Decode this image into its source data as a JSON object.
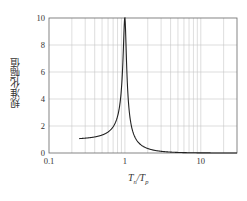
{
  "chart_data": {
    "type": "line",
    "title": "",
    "xlabel": "Tn/Tp",
    "xlabel_parts": {
      "main1": "T",
      "sub1": "n",
      "sep": "/",
      "main2": "T",
      "sub2": "p"
    },
    "ylabel": "规准化幅值",
    "xscale": "log",
    "xlim": [
      0.1,
      30
    ],
    "ylim": [
      0,
      10
    ],
    "xticks": [
      0.1,
      1,
      10
    ],
    "xtick_labels": [
      "0.1",
      "1",
      "10"
    ],
    "yticks": [
      0,
      2,
      4,
      6,
      8,
      10
    ],
    "ytick_labels": [
      "0",
      "2",
      "4",
      "6",
      "8",
      "10"
    ],
    "grid": true,
    "legend": null,
    "series": [
      {
        "name": "normalized amplitude",
        "x": [
          0.25,
          0.3,
          0.4,
          0.5,
          0.6,
          0.7,
          0.8,
          0.9,
          0.95,
          1.0,
          1.05,
          1.1,
          1.2,
          1.5,
          2,
          3,
          5,
          10,
          30
        ],
        "y": [
          1.07,
          1.1,
          1.19,
          1.33,
          1.56,
          1.95,
          2.74,
          5.0,
          8.5,
          10.0,
          8.7,
          4.5,
          2.2,
          0.79,
          0.33,
          0.125,
          0.042,
          0.01,
          0.001
        ]
      }
    ],
    "colors": {
      "line": "#222222",
      "grid": "#c8c8c8",
      "axis": "#555555"
    }
  }
}
